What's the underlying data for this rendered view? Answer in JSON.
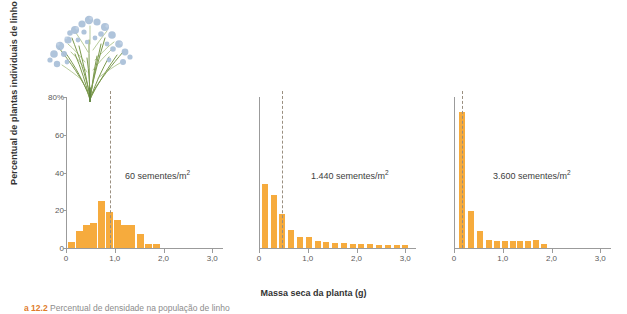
{
  "figure": {
    "ylabel": "Percentual de plantas individuais de linho",
    "xlabel": "Massa seca da planta (g)",
    "caption_number": "a 12.2",
    "caption_text": "Percentual de densidade na população de linho",
    "accent_color": "#f6ab3d",
    "axis_color": "#9b9b9b",
    "vline_color": "#9a8f80",
    "illustration": "flax-plant-illustration"
  },
  "chart_data": {
    "type": "bar",
    "title": "",
    "xlabel": "Massa seca da planta (g)",
    "ylabel": "Percentual de plantas individuais de linho",
    "xlim": [
      0,
      3.2
    ],
    "ylim": [
      0,
      80
    ],
    "grid": false,
    "legend": "none",
    "yticks": [
      0,
      20,
      40,
      60,
      80
    ],
    "ytick_labels": [
      "0",
      "20",
      "40",
      "60",
      "80%"
    ],
    "xticks": [
      0,
      1.0,
      2.0,
      3.0
    ],
    "xtick_labels": [
      "0",
      "1,0",
      "2,0",
      "3,0"
    ],
    "panels": [
      {
        "name": "60 sementes/m2",
        "label": "60 sementes/m",
        "label_sup": "2",
        "mean_line_x": 0.88,
        "x": [
          0.1,
          0.25,
          0.4,
          0.55,
          0.7,
          0.88,
          1.03,
          1.18,
          1.33,
          1.5,
          1.67,
          1.84
        ],
        "values": [
          3,
          9,
          12,
          13,
          25,
          19,
          15,
          12,
          12,
          7.5,
          2,
          2
        ]
      },
      {
        "name": "1.440 sementes/m2",
        "label": "1.440 sementes/m",
        "label_sup": "2",
        "mean_line_x": 0.46,
        "x": [
          0.1,
          0.28,
          0.46,
          0.64,
          0.82,
          1.0,
          1.18,
          1.36,
          1.54,
          1.72,
          1.9,
          2.08,
          2.26,
          2.44,
          2.62,
          2.8,
          2.98
        ],
        "values": [
          34,
          28,
          18,
          9.5,
          6,
          6,
          3.5,
          3,
          2.5,
          2.5,
          2,
          2,
          2,
          1.8,
          1.8,
          1.5,
          1.5
        ]
      },
      {
        "name": "3.600 sementes/m2",
        "label": "3.600 sementes/m",
        "label_sup": "2",
        "mean_line_x": 0.14,
        "x": [
          0.14,
          0.33,
          0.52,
          0.7,
          0.86,
          1.02,
          1.18,
          1.34,
          1.5,
          1.66,
          1.82
        ],
        "values": [
          72,
          19.5,
          9,
          4.5,
          3.5,
          3.5,
          3.5,
          3.5,
          3.5,
          4.5,
          2
        ]
      }
    ]
  }
}
